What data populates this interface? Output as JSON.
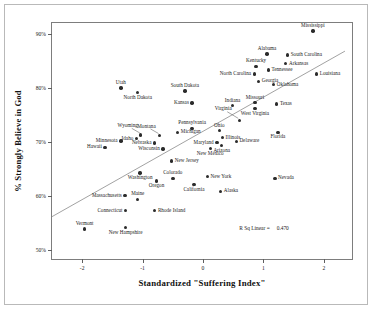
{
  "chart_data": {
    "type": "scatter",
    "title": "",
    "xlabel": "Standardized \"Suffering Index\"",
    "ylabel": "% Strongly Believe in God",
    "xlim": [
      -2.5,
      2.5
    ],
    "ylim": [
      48,
      92
    ],
    "xticks": [
      "-2",
      "-1",
      "0",
      "1",
      "2"
    ],
    "xtick_values": [
      -2,
      -1,
      0,
      1,
      2
    ],
    "yticks": [
      "50%",
      "60%",
      "70%",
      "80%",
      "90%"
    ],
    "ytick_values": [
      50,
      60,
      70,
      80,
      90
    ],
    "grid": false,
    "legend": false,
    "annotation_label": "R Sq Linear =",
    "annotation_value": "0.470",
    "trendline": {
      "x0": -2.5,
      "y0": 56.2,
      "x1": 2.35,
      "y1": 86.8
    },
    "point_color": "#2b2b2b",
    "line_color": "#8a8a8a",
    "points": [
      {
        "label": "Mississippi",
        "x": 1.82,
        "y": 90.5,
        "pos": "above"
      },
      {
        "label": "Alabama",
        "x": 1.06,
        "y": 86.3,
        "pos": "above"
      },
      {
        "label": "South Carolina",
        "x": 1.4,
        "y": 86.1,
        "pos": "right"
      },
      {
        "label": "Arkansas",
        "x": 1.37,
        "y": 84.5,
        "pos": "right"
      },
      {
        "label": "Kentucky",
        "x": 0.88,
        "y": 84.0,
        "pos": "above"
      },
      {
        "label": "Tennessee",
        "x": 1.08,
        "y": 83.3,
        "pos": "right"
      },
      {
        "label": "North Carolina",
        "x": 0.85,
        "y": 82.6,
        "pos": "left"
      },
      {
        "label": "Louisiana",
        "x": 1.88,
        "y": 82.6,
        "pos": "right"
      },
      {
        "label": "Georgia",
        "x": 0.92,
        "y": 81.2,
        "pos": "right"
      },
      {
        "label": "Oklahoma",
        "x": 1.17,
        "y": 80.6,
        "pos": "right"
      },
      {
        "label": "Utah",
        "x": -1.36,
        "y": 80.0,
        "pos": "above"
      },
      {
        "label": "South Dakota",
        "x": -0.3,
        "y": 79.4,
        "pos": "above"
      },
      {
        "label": "North Dakota",
        "x": -1.08,
        "y": 79.1,
        "pos": "below"
      },
      {
        "label": "Missouri",
        "x": 0.86,
        "y": 77.3,
        "pos": "above"
      },
      {
        "label": "Kansas",
        "x": -0.18,
        "y": 77.2,
        "pos": "left"
      },
      {
        "label": "Texas",
        "x": 1.22,
        "y": 77.0,
        "pos": "right"
      },
      {
        "label": "Indiana",
        "x": 0.49,
        "y": 76.7,
        "pos": "above"
      },
      {
        "label": "West Virginia",
        "x": 0.86,
        "y": 76.2,
        "pos": "below"
      },
      {
        "label": "Virginia",
        "x": 0.6,
        "y": 74.0,
        "pos": "leader-upleft"
      },
      {
        "label": "Pennsylvania",
        "x": -0.18,
        "y": 72.5,
        "pos": "above"
      },
      {
        "label": "Ohio",
        "x": 0.27,
        "y": 72.1,
        "pos": "above"
      },
      {
        "label": "Michigan",
        "x": -0.42,
        "y": 71.8,
        "pos": "right"
      },
      {
        "label": "Montana",
        "x": -0.72,
        "y": 71.2,
        "pos": "leader-up"
      },
      {
        "label": "Wyoming",
        "x": -1.03,
        "y": 71.3,
        "pos": "leader-up"
      },
      {
        "label": "Florida",
        "x": 1.24,
        "y": 71.8,
        "pos": "below"
      },
      {
        "label": "Illinois",
        "x": 0.32,
        "y": 70.8,
        "pos": "right"
      },
      {
        "label": "Idaho",
        "x": -1.1,
        "y": 70.6,
        "pos": "left"
      },
      {
        "label": "Minnesota",
        "x": -1.36,
        "y": 70.2,
        "pos": "left"
      },
      {
        "label": "Delaware",
        "x": 0.55,
        "y": 70.1,
        "pos": "right"
      },
      {
        "label": "Maryland",
        "x": 0.23,
        "y": 69.9,
        "pos": "left"
      },
      {
        "label": "Nebraska",
        "x": -0.8,
        "y": 69.8,
        "pos": "left"
      },
      {
        "label": "Arizona",
        "x": 0.31,
        "y": 69.3,
        "pos": "below"
      },
      {
        "label": "Hawaii",
        "x": -1.62,
        "y": 69.0,
        "pos": "left"
      },
      {
        "label": "Wisconsin",
        "x": -0.66,
        "y": 68.7,
        "pos": "left"
      },
      {
        "label": "New Mexico",
        "x": 0.12,
        "y": 68.8,
        "pos": "below"
      },
      {
        "label": "New Jersey",
        "x": -0.52,
        "y": 66.5,
        "pos": "right"
      },
      {
        "label": "Washington",
        "x": -1.04,
        "y": 64.3,
        "pos": "below"
      },
      {
        "label": "New York",
        "x": 0.07,
        "y": 63.6,
        "pos": "right"
      },
      {
        "label": "Colorado",
        "x": -0.5,
        "y": 63.3,
        "pos": "above"
      },
      {
        "label": "Nevada",
        "x": 1.19,
        "y": 63.3,
        "pos": "right"
      },
      {
        "label": "Oregon",
        "x": -0.77,
        "y": 62.8,
        "pos": "below"
      },
      {
        "label": "California",
        "x": -0.15,
        "y": 62.1,
        "pos": "below"
      },
      {
        "label": "Alaska",
        "x": 0.29,
        "y": 60.9,
        "pos": "right"
      },
      {
        "label": "Maine",
        "x": -1.08,
        "y": 59.4,
        "pos": "above"
      },
      {
        "label": "Massachusetts",
        "x": -1.29,
        "y": 60.1,
        "pos": "left"
      },
      {
        "label": "Connecticut",
        "x": -1.28,
        "y": 57.3,
        "pos": "left"
      },
      {
        "label": "Rhode Island",
        "x": -0.8,
        "y": 57.3,
        "pos": "right"
      },
      {
        "label": "New Hampshire",
        "x": -1.28,
        "y": 54.2,
        "pos": "below"
      },
      {
        "label": "Vermont",
        "x": -1.96,
        "y": 53.9,
        "pos": "above"
      }
    ]
  }
}
